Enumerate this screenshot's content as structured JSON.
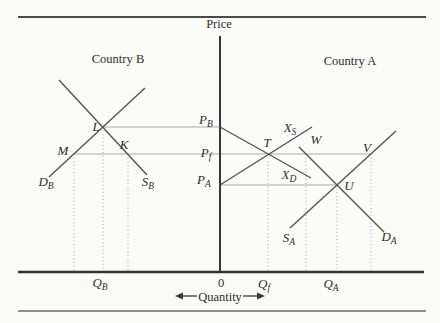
{
  "figure": {
    "price_axis_label": "Price",
    "quantity_axis_label": "Quantity",
    "origin_label": "0",
    "left_panel_title": "Country B",
    "right_panel_title": "Country A"
  },
  "price_levels": {
    "p_b": {
      "main": "P",
      "sub": "B"
    },
    "p_f": {
      "main": "P",
      "sub": "f"
    },
    "p_a": {
      "main": "P",
      "sub": "A"
    }
  },
  "quantity_levels": {
    "q_b": {
      "main": "Q",
      "sub": "B"
    },
    "q_f": {
      "main": "Q",
      "sub": "f"
    },
    "q_a": {
      "main": "Q",
      "sub": "A"
    }
  },
  "curve_labels": {
    "d_b": {
      "main": "D",
      "sub": "B"
    },
    "s_b": {
      "main": "S",
      "sub": "B"
    },
    "x_s": {
      "main": "X",
      "sub": "S"
    },
    "x_d": {
      "main": "X",
      "sub": "D"
    },
    "s_a": {
      "main": "S",
      "sub": "A"
    },
    "d_a": {
      "main": "D",
      "sub": "A"
    }
  },
  "point_labels": {
    "l": "L",
    "m": "M",
    "k": "K",
    "t": "T",
    "w": "W",
    "v": "V",
    "u": "U"
  },
  "colors": {
    "background": "#fbfbf8",
    "curve": "#545454",
    "axis": "#363636",
    "guide": "#ababab",
    "rule": "#4a4a4a",
    "text": "#2e2e2e"
  }
}
